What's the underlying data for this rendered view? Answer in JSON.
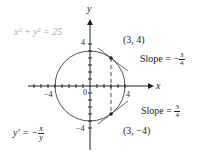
{
  "equation": "x² + y² = 25",
  "derivative": {
    "lhs": "y′ = −",
    "num": "x",
    "den": "y"
  },
  "axes": {
    "x_label": "x",
    "y_label": "y",
    "origin": "0",
    "x_ticks": [
      "−4",
      "4"
    ],
    "y_ticks": [
      "4",
      "−4"
    ]
  },
  "points": [
    {
      "label": "(3, 4)",
      "slope_text": "Slope = −",
      "slope_num": "3",
      "slope_den": "4"
    },
    {
      "label": "(3, −4)",
      "slope_text": "Slope = ",
      "slope_num": "3",
      "slope_den": "4"
    }
  ],
  "colors": {
    "curve": "#555555",
    "axis": "#222222",
    "equation": "#aaaaaa"
  }
}
